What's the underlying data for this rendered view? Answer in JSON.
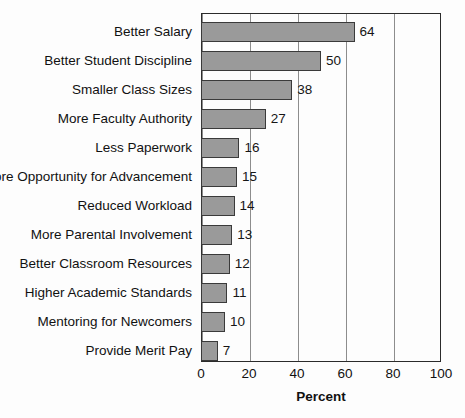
{
  "chart_data": {
    "type": "bar",
    "orientation": "horizontal",
    "title": "",
    "xlabel": "Percent",
    "ylabel": "",
    "xlim": [
      0,
      100
    ],
    "xticks": [
      0,
      20,
      40,
      60,
      80,
      100
    ],
    "grid": "vertical",
    "legend": null,
    "bar_color": "#9a9a9a",
    "bar_edge_color": "#3a3a3a",
    "categories": [
      "Better Salary",
      "Better Student Discipline",
      "Smaller Class Sizes",
      "More Faculty Authority",
      "Less Paperwork",
      "More Opportunity for Advancement",
      "Reduced Workload",
      "More Parental Involvement",
      "Better Classroom Resources",
      "Higher Academic Standards",
      "Mentoring for Newcomers",
      "Provide Merit Pay"
    ],
    "values": [
      64,
      50,
      38,
      27,
      16,
      15,
      14,
      13,
      12,
      11,
      10,
      7
    ],
    "value_labels": [
      "64",
      "50",
      "38",
      "27",
      "16",
      "15",
      "14",
      "13",
      "12",
      "11",
      "10",
      "7"
    ]
  }
}
